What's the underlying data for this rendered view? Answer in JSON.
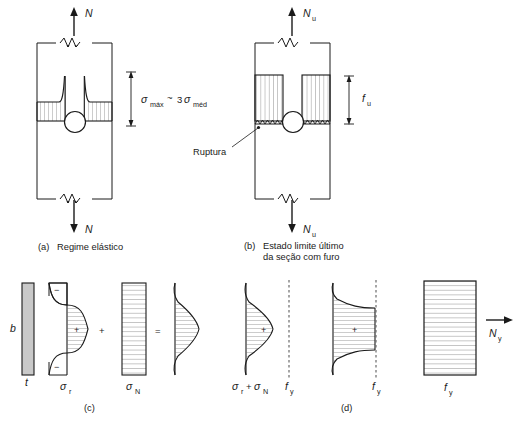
{
  "figure": {
    "colors": {
      "stroke": "#1a1a1a",
      "hatch": "#6b6b6b",
      "plate_fill": "#c9c9c9",
      "background": "#ffffff"
    }
  },
  "panel_a": {
    "id": "(a)",
    "caption": "Regime elástico",
    "force_top": "N",
    "force_bottom": "N",
    "annotation": "σmáx ~ 3σméd",
    "annotation_parts": {
      "sigma": "σ",
      "sub_max": "máx",
      "approx": "~",
      "factor": "3",
      "sub_med": "méd"
    }
  },
  "panel_b": {
    "id": "(b)",
    "caption_line1": "Estado limite último",
    "caption_line2": "da seção com furo",
    "force_top": "Nu",
    "force_bottom": "Nu",
    "force_symbol": "N",
    "force_sub": "u",
    "dimension_label": "fu",
    "dimension_symbol": "f",
    "dimension_sub": "u",
    "fracture_label": "Ruptura"
  },
  "panel_c": {
    "id": "(c)",
    "section": {
      "width_label": "b",
      "thickness_label": "t"
    },
    "diagrams": [
      {
        "name": "residual-stress",
        "label_symbol": "σ",
        "label_sub": "r",
        "label": "σr",
        "signs": [
          "−",
          "+",
          "−"
        ]
      },
      {
        "name": "axial-stress",
        "label_symbol": "σ",
        "label_sub": "N",
        "label": "σN",
        "signs": []
      },
      {
        "name": "combined-stress",
        "label_symbol": "",
        "label_sub": "",
        "label": "",
        "signs": []
      }
    ],
    "operators": [
      "+",
      "="
    ]
  },
  "panel_d": {
    "id": "(d)",
    "diagrams": [
      {
        "name": "elastic-combined",
        "label": "σr + σN",
        "label_parts": {
          "s1": "σ",
          "sub1": "r",
          "plus": "+",
          "s2": "σ",
          "sub2": "N"
        },
        "limit_label": "fy",
        "limit_symbol": "f",
        "limit_sub": "y",
        "sign": "+"
      },
      {
        "name": "partial-yield",
        "label": "",
        "limit_label": "fy",
        "limit_symbol": "f",
        "limit_sub": "y",
        "sign": "+"
      },
      {
        "name": "full-yield",
        "label": "fy",
        "limit_symbol": "f",
        "limit_sub": "y",
        "force_label": "Ny",
        "force_symbol": "N",
        "force_sub": "y"
      }
    ]
  }
}
